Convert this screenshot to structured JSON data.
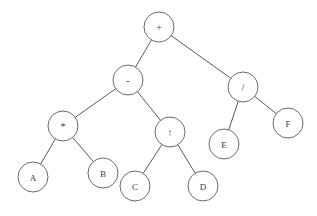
{
  "diagram": {
    "type": "binary-tree",
    "background_color": "#ffffff",
    "edge_color": "#5a5a5a",
    "node_stroke_color": "#6a6a6a",
    "node_fill_color": "#ffffff",
    "label_color": "#3a3a3a",
    "node_radius": 15
  },
  "nodes": [
    {
      "id": "root",
      "label": "+",
      "kind": "operator",
      "x": 159,
      "y": 27,
      "r": 15,
      "level": 0
    },
    {
      "id": "minus",
      "label": "-",
      "kind": "operator",
      "x": 128,
      "y": 80,
      "r": 15,
      "level": 1
    },
    {
      "id": "div",
      "label": "/",
      "kind": "operator",
      "x": 243,
      "y": 87,
      "r": 15,
      "level": 1
    },
    {
      "id": "mul",
      "label": "*",
      "kind": "operator",
      "x": 63,
      "y": 126,
      "r": 15,
      "level": 2
    },
    {
      "id": "pow",
      "label": "↑",
      "kind": "operator",
      "x": 170,
      "y": 132,
      "r": 15,
      "level": 2
    },
    {
      "id": "leafE",
      "label": "E",
      "kind": "operand",
      "x": 224,
      "y": 144,
      "r": 15,
      "level": 2
    },
    {
      "id": "leafF",
      "label": "F",
      "kind": "operand",
      "x": 288,
      "y": 123,
      "r": 15,
      "level": 2
    },
    {
      "id": "leafA",
      "label": "A",
      "kind": "operand",
      "x": 33,
      "y": 177,
      "r": 15,
      "level": 3
    },
    {
      "id": "leafB",
      "label": "B",
      "kind": "operand",
      "x": 103,
      "y": 173,
      "r": 15,
      "level": 3
    },
    {
      "id": "leafC",
      "label": "C",
      "kind": "operand",
      "x": 135,
      "y": 186,
      "r": 15,
      "level": 3
    },
    {
      "id": "leafD",
      "label": "D",
      "kind": "operand",
      "x": 203,
      "y": 186,
      "r": 15,
      "level": 3
    }
  ],
  "edges": [
    {
      "id": "e-root-minus",
      "from": "root",
      "to": "minus",
      "side": "left"
    },
    {
      "id": "e-root-div",
      "from": "root",
      "to": "div",
      "side": "right"
    },
    {
      "id": "e-minus-mul",
      "from": "minus",
      "to": "mul",
      "side": "left"
    },
    {
      "id": "e-minus-pow",
      "from": "minus",
      "to": "pow",
      "side": "right"
    },
    {
      "id": "e-div-e",
      "from": "div",
      "to": "leafE",
      "side": "left"
    },
    {
      "id": "e-div-f",
      "from": "div",
      "to": "leafF",
      "side": "right"
    },
    {
      "id": "e-mul-a",
      "from": "mul",
      "to": "leafA",
      "side": "left"
    },
    {
      "id": "e-mul-b",
      "from": "mul",
      "to": "leafB",
      "side": "right"
    },
    {
      "id": "e-pow-c",
      "from": "pow",
      "to": "leafC",
      "side": "left"
    },
    {
      "id": "e-pow-d",
      "from": "pow",
      "to": "leafD",
      "side": "right"
    }
  ]
}
